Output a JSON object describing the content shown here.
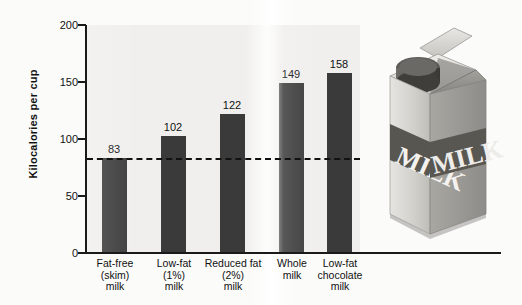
{
  "chart_data": {
    "type": "bar",
    "title": "",
    "xlabel": "",
    "ylabel": "Kilocalories per cup",
    "categories": [
      "Fat-free\n(skim)\nmilk",
      "Low-fat\n(1%)\nmilk",
      "Reduced fat\n(2%)\nmilk",
      "Whole\nmilk",
      "Low-fat\nchocolate\nmilk"
    ],
    "category_lines": [
      [
        "Fat-free",
        "(skim)",
        "milk"
      ],
      [
        "Low-fat",
        "(1%)",
        "milk"
      ],
      [
        "Reduced fat",
        "(2%)",
        "milk"
      ],
      [
        "Whole",
        "milk"
      ],
      [
        "Low-fat",
        "chocolate",
        "milk"
      ]
    ],
    "values": [
      83,
      102,
      122,
      149,
      158
    ],
    "value_labels": [
      "83",
      "102",
      "122",
      "149",
      "158"
    ],
    "ylim": [
      0,
      200
    ],
    "yticks": [
      0,
      50,
      100,
      150,
      200
    ],
    "ytick_labels": [
      "0",
      "50",
      "100",
      "150",
      "200"
    ],
    "grid": false,
    "legend": null,
    "reference_line": {
      "value": 83,
      "style": "dashed",
      "label": ""
    },
    "colors": {
      "bar": "#3a3a3a",
      "axis": "#1a1a1a",
      "plot_background": "#f0efed",
      "page_background": "#fdfdfd",
      "reference_line": "#111111"
    }
  },
  "artwork": {
    "name": "milk-carton-photo",
    "front_label_text": "MILK",
    "side_label_text": "MILK",
    "cap": "screw-cap"
  }
}
